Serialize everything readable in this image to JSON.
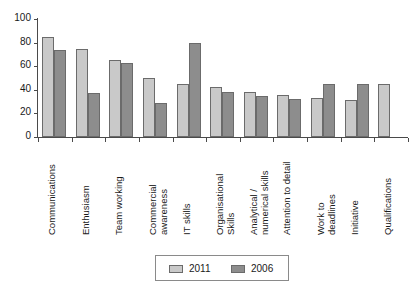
{
  "chart_data": {
    "type": "bar",
    "title": "",
    "subtitle": "",
    "xlabel": "",
    "ylabel": "",
    "ylim": [
      0,
      100
    ],
    "yticks": [
      0,
      20,
      40,
      60,
      80,
      100
    ],
    "grid": false,
    "legend_position": "bottom-center",
    "categories": [
      "Communications",
      "Enthusiasm",
      "Team working",
      "Commercial awareness",
      "IT skills",
      "Organisational Skills",
      "Analytical / numerical skills",
      "Attention to detail",
      "Work to deadlines",
      "Initiative",
      "Qualifications"
    ],
    "category_lines": [
      [
        "Communications"
      ],
      [
        "Enthusiasm"
      ],
      [
        "Team working"
      ],
      [
        "Commercial",
        "awareness"
      ],
      [
        "IT skills"
      ],
      [
        "Organisational",
        "Skills"
      ],
      [
        "Analytical /",
        "numerical skills"
      ],
      [
        "Attention to detail"
      ],
      [
        "Work to",
        "deadlines"
      ],
      [
        "Initiative"
      ],
      [
        "Qualifications"
      ]
    ],
    "series": [
      {
        "name": "2011",
        "color": "#c9c9c9",
        "values": [
          85,
          75,
          65,
          50,
          45,
          42,
          38,
          36,
          33,
          31,
          45
        ]
      },
      {
        "name": "2006",
        "color": "#8d8d8d",
        "values": [
          74,
          37,
          63,
          29,
          80,
          38,
          35,
          32,
          45,
          45,
          null
        ]
      }
    ]
  },
  "legend": {
    "entries": [
      {
        "label": "2011",
        "color": "#c9c9c9"
      },
      {
        "label": "2006",
        "color": "#8d8d8d"
      }
    ]
  },
  "axis": {
    "y_tick_labels": [
      "100",
      "80",
      "60",
      "40",
      "20",
      "0"
    ]
  }
}
